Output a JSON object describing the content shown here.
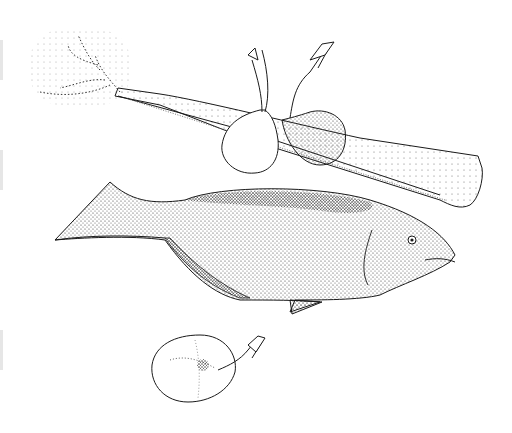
{
  "illustration": {
    "style": "black-and-white stipple line drawing",
    "subjects": [
      "celery-stalk",
      "shrimp-pair",
      "fish",
      "single-shrimp"
    ],
    "colors": {
      "background": "#ffffff",
      "ink": "#1a1a1a",
      "stipple": "#333333"
    }
  }
}
